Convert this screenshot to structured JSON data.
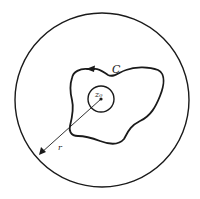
{
  "diagram": {
    "labels": {
      "contour": "C",
      "center": "z₀",
      "radius": "r"
    },
    "colors": {
      "stroke": "#1a1a1a",
      "background": "#ffffff"
    }
  }
}
